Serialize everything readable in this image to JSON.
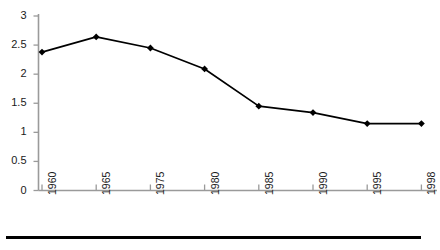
{
  "chart_data": {
    "type": "line",
    "title": "",
    "subtitle": "",
    "xlabel": "",
    "ylabel": "",
    "categories": [
      "1960",
      "1965",
      "1975",
      "1980",
      "1985",
      "1990",
      "1995",
      "1998"
    ],
    "values": [
      2.38,
      2.64,
      2.45,
      2.09,
      1.45,
      1.34,
      1.15,
      1.15
    ],
    "series": [
      {
        "name": "series-1",
        "values": [
          2.38,
          2.64,
          2.45,
          2.09,
          1.45,
          1.34,
          1.15,
          1.15
        ]
      }
    ],
    "ylim": [
      0,
      3
    ],
    "ytick_labels": [
      "0",
      "0.5",
      "1",
      "1.5",
      "2",
      "2.5",
      "3"
    ],
    "ytick_values": [
      0,
      0.5,
      1,
      1.5,
      2,
      2.5,
      3
    ],
    "grid": false,
    "legend": false,
    "legend_position": "none",
    "marker": "diamond",
    "line_color": "#000000",
    "marker_color": "#000000",
    "axis_color": "#9a9a9a",
    "xtick_label_rotation": -90,
    "annotations": [],
    "footer_rule": true
  }
}
